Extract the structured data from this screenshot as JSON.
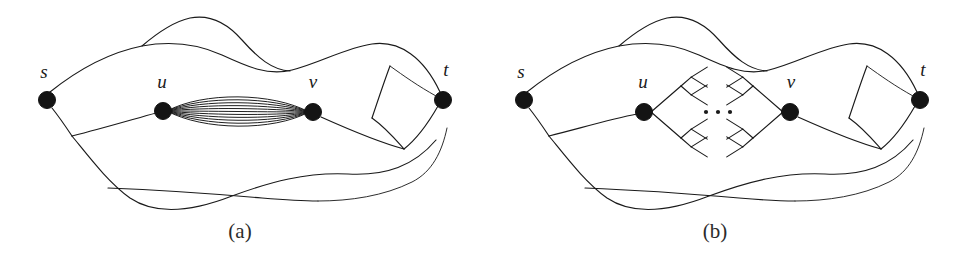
{
  "figure": {
    "background_color": "#ffffff",
    "ink_color": "#1a1a1a",
    "panels": [
      {
        "id": "panel-a",
        "caption": "(a)",
        "caption_x": 240,
        "caption_y": 238,
        "description": "Graph with many parallel edges between u and v",
        "nodes": [
          {
            "id": "s",
            "label": "s",
            "x": 47,
            "y": 100,
            "r": 8.5,
            "label_x": 44,
            "label_y": 78
          },
          {
            "id": "u",
            "label": "u",
            "x": 163,
            "y": 111,
            "r": 8.5,
            "label_x": 162,
            "label_y": 88
          },
          {
            "id": "v",
            "label": "v",
            "x": 313,
            "y": 112,
            "r": 8.5,
            "label_x": 313,
            "label_y": 88
          },
          {
            "id": "t",
            "label": "t",
            "x": 443,
            "y": 100,
            "r": 8.5,
            "label_x": 446,
            "label_y": 76
          }
        ],
        "parallel_edge_count": 11,
        "bundle_max_spread": 27
      },
      {
        "id": "panel-b",
        "caption": "(b)",
        "caption_x": 715,
        "caption_y": 238,
        "description": "Same graph with the parallel edges replaced by binary trees hanging off u and v, separated by an ellipsis",
        "nodes": [
          {
            "id": "s",
            "label": "s",
            "x": 524,
            "y": 100,
            "r": 8.5,
            "label_x": 521,
            "label_y": 78
          },
          {
            "id": "u",
            "label": "u",
            "x": 644,
            "y": 112,
            "r": 8.5,
            "label_x": 643,
            "label_y": 88
          },
          {
            "id": "v",
            "label": "v",
            "x": 790,
            "y": 112,
            "r": 8.5,
            "label_x": 791,
            "label_y": 88
          },
          {
            "id": "t",
            "label": "t",
            "x": 920,
            "y": 100,
            "r": 8.5,
            "label_x": 923,
            "label_y": 76
          }
        ],
        "ellipsis": {
          "dots": 3,
          "x_start": 706,
          "y": 112,
          "spacing": 12,
          "radius": 2.1
        },
        "tree_depth": 2,
        "tree_branching": 2
      }
    ]
  }
}
